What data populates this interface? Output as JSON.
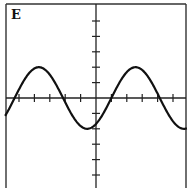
{
  "chart_data": {
    "type": "line",
    "title": "",
    "panel_label": "E",
    "xlabel": "",
    "ylabel": "",
    "xlim": [
      -5.9,
      5.9
    ],
    "ylim": [
      -5.9,
      6.2
    ],
    "x_ticks": [
      -5,
      -4,
      -3,
      -2,
      -1,
      1,
      2,
      3,
      4,
      5
    ],
    "y_ticks": [
      -5,
      -4,
      -3,
      -2,
      -1,
      1,
      2,
      3,
      4,
      5
    ],
    "tick_labels_shown": false,
    "grid": false,
    "legend": "none",
    "series": [
      {
        "name": "curve",
        "function": "y = 2*sin(x - 1)",
        "amplitude": 2,
        "period": 6.283,
        "phase_shift": 1,
        "key_points": {
          "peaks": [
            [
              -3.71,
              2
            ],
            [
              2.57,
              2
            ]
          ],
          "troughs": [
            [
              -0.57,
              -2
            ]
          ],
          "zero_crossings": [
            -5.28,
            -2.14,
            1.0,
            4.14
          ]
        },
        "color": "#111111"
      }
    ]
  }
}
